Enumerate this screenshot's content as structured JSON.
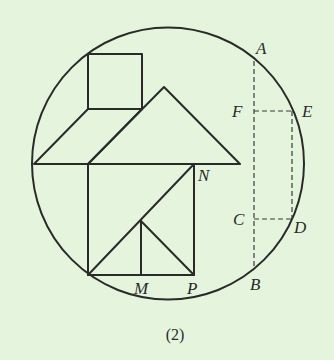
{
  "diagram": {
    "caption": "(2)",
    "background_color": "#e5f5dd",
    "line_color": "#2a2a2a",
    "labels": {
      "A": "A",
      "B": "B",
      "C": "C",
      "D": "D",
      "E": "E",
      "F": "F",
      "M": "M",
      "N": "N",
      "P": "P"
    }
  }
}
